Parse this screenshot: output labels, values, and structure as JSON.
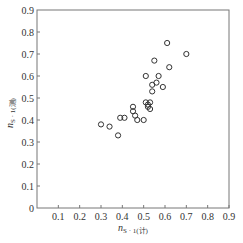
{
  "chart_data": {
    "type": "scatter",
    "title": "",
    "xlabel": "n_S·1(计)",
    "ylabel": "n_S·1(测)",
    "xlabel_main": "n",
    "xlabel_sub": "S · 1(计)",
    "ylabel_main": "n",
    "ylabel_sub": "S · 1(测)",
    "xlim": [
      0,
      0.9
    ],
    "ylim": [
      0,
      0.9
    ],
    "x_ticks": [
      "0.1",
      "0.2",
      "0.3",
      "0.4",
      "0.5",
      "0.6",
      "0.7",
      "0.8",
      "0.9"
    ],
    "y_ticks": [
      "0",
      "0.1",
      "0.2",
      "0.3",
      "0.4",
      "0.5",
      "0.6",
      "0.7",
      "0.8",
      "0.9"
    ],
    "grid": false,
    "legend": null,
    "marker": "open-circle",
    "series": [
      {
        "name": "data",
        "points": [
          [
            0.3,
            0.38
          ],
          [
            0.34,
            0.37
          ],
          [
            0.38,
            0.33
          ],
          [
            0.39,
            0.41
          ],
          [
            0.41,
            0.41
          ],
          [
            0.45,
            0.46
          ],
          [
            0.45,
            0.44
          ],
          [
            0.46,
            0.42
          ],
          [
            0.47,
            0.4
          ],
          [
            0.5,
            0.4
          ],
          [
            0.51,
            0.48
          ],
          [
            0.53,
            0.48
          ],
          [
            0.52,
            0.46
          ],
          [
            0.53,
            0.45
          ],
          [
            0.52,
            0.47
          ],
          [
            0.54,
            0.53
          ],
          [
            0.59,
            0.55
          ],
          [
            0.54,
            0.56
          ],
          [
            0.56,
            0.57
          ],
          [
            0.51,
            0.6
          ],
          [
            0.57,
            0.6
          ],
          [
            0.55,
            0.67
          ],
          [
            0.62,
            0.64
          ],
          [
            0.61,
            0.75
          ],
          [
            0.7,
            0.7
          ]
        ]
      }
    ]
  },
  "colors": {
    "axis": "#777777",
    "marker_stroke": "#333333",
    "text": "#333333"
  }
}
